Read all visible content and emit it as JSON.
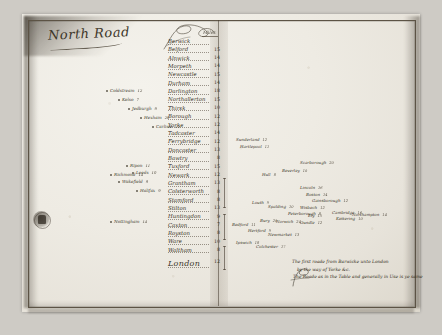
{
  "document": {
    "title": "North Road",
    "column_header": "Miles",
    "terminal_label": "London",
    "terminal_miles": "12"
  },
  "itinerary": [
    {
      "town": "Berwick",
      "miles": ""
    },
    {
      "town": "Belford",
      "miles": "15"
    },
    {
      "town": "Alnwick",
      "miles": "14"
    },
    {
      "town": "Morpeth",
      "miles": "14"
    },
    {
      "town": "Newcastle",
      "miles": "15"
    },
    {
      "town": "Durham",
      "miles": "14"
    },
    {
      "town": "Darlington",
      "miles": "18"
    },
    {
      "town": "Northallerton",
      "miles": "15"
    },
    {
      "town": "Thirsk",
      "miles": "10"
    },
    {
      "town": "Borough",
      "miles": "12"
    },
    {
      "town": "Yorke",
      "miles": "12"
    },
    {
      "town": "Tadcaster",
      "miles": "14"
    },
    {
      "town": "Ferrybridge",
      "miles": "12"
    },
    {
      "town": "Doncaster",
      "miles": "13"
    },
    {
      "town": "Bawtry",
      "miles": "8"
    },
    {
      "town": "Tuxford",
      "miles": "15"
    },
    {
      "town": "Newark",
      "miles": "12"
    },
    {
      "town": "Grantham",
      "miles": "13"
    },
    {
      "town": "Colsterworth",
      "miles": "8"
    },
    {
      "town": "Stamford",
      "miles": "8"
    },
    {
      "town": "Stilton",
      "miles": "13"
    },
    {
      "town": "Huntingdon",
      "miles": "9"
    },
    {
      "town": "Caxton",
      "miles": "7"
    },
    {
      "town": "Royston",
      "miles": "8"
    },
    {
      "town": "Ware",
      "miles": "10"
    },
    {
      "town": "Waltham",
      "miles": "8"
    }
  ],
  "branches_left": [
    {
      "label": "Coldstream",
      "miles": "12"
    },
    {
      "label": "Kelso",
      "miles": "7"
    },
    {
      "label": "Jedburgh",
      "miles": "9"
    },
    {
      "label": "Hexham",
      "miles": "20"
    },
    {
      "label": "Carlisle",
      "miles": "22"
    },
    {
      "label": "Ripon",
      "miles": "11"
    },
    {
      "label": "Richmond",
      "miles": "14"
    },
    {
      "label": "Leeds",
      "miles": "10"
    },
    {
      "label": "Wakefield",
      "miles": "9"
    },
    {
      "label": "Halifax",
      "miles": "9"
    },
    {
      "label": "Nottingham",
      "miles": "14"
    }
  ],
  "branches_right": [
    {
      "label": "Sunderland",
      "miles": "12"
    },
    {
      "label": "Hartlepool",
      "miles": "11"
    },
    {
      "label": "Scarborough",
      "miles": "20"
    },
    {
      "label": "Beverley",
      "miles": "10"
    },
    {
      "label": "Hull",
      "miles": "8"
    },
    {
      "label": "Lincoln",
      "miles": "16"
    },
    {
      "label": "Boston",
      "miles": "14"
    },
    {
      "label": "Gainsborough",
      "miles": "12"
    },
    {
      "label": "Louth",
      "miles": "9"
    },
    {
      "label": "Spalding",
      "miles": "10"
    },
    {
      "label": "Wisbech",
      "miles": "12"
    },
    {
      "label": "Peterborough",
      "miles": "8"
    },
    {
      "label": "Ely",
      "miles": "15"
    },
    {
      "label": "Cambridge",
      "miles": "16"
    },
    {
      "label": "Bury",
      "miles": "20"
    },
    {
      "label": "Norwich",
      "miles": "24"
    },
    {
      "label": "Oundle",
      "miles": "12"
    },
    {
      "label": "Kettering",
      "miles": "10"
    },
    {
      "label": "Northampton",
      "miles": "14"
    },
    {
      "label": "Bedford",
      "miles": "11"
    },
    {
      "label": "Hertford",
      "miles": "9"
    },
    {
      "label": "Newmarket",
      "miles": "13"
    },
    {
      "label": "Ipswich",
      "miles": "18"
    },
    {
      "label": "Colchester",
      "miles": "17"
    }
  ],
  "memorandum": {
    "line1": "The first roade from Barwicke unto London",
    "line2": "by the way of Yorke &c.",
    "line3": "The Roade as in the Table and generally in Use is ye same"
  },
  "stamp": {
    "name": "archive-stamp"
  }
}
